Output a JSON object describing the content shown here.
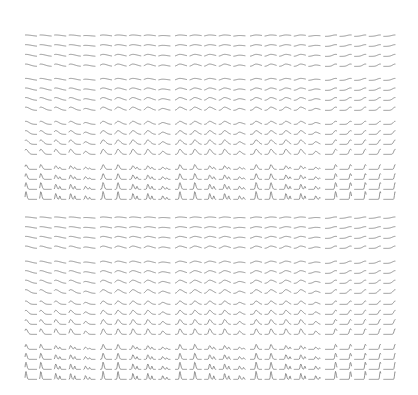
{
  "chart_data": {
    "type": "line",
    "title": "",
    "layout": {
      "columns": 25,
      "rows": 32,
      "column_groups": 5,
      "columns_per_group": 5,
      "row_groups": 8,
      "rows_per_group": 4,
      "column_group_x": [
        25,
        100,
        175,
        250,
        325
      ],
      "column_stride": 14.6,
      "row_group_y": [
        29,
        73,
        117,
        162,
        211,
        256,
        297,
        342
      ],
      "row_stride": 10,
      "cell_width": 12,
      "cell_height": 8
    },
    "style": {
      "stroke": "#7a7a7a",
      "stroke_width": 0.8,
      "background": "#ffffff"
    },
    "series_model": {
      "note": "Each sparkline is a skewed peak; peak position shifts right across column groups, peak sharpness/height grows down rows within each row group and across row groups.",
      "peak_position_by_column_group": [
        0.12,
        0.3,
        0.45,
        0.55,
        0.92
      ],
      "peak_height_by_row_group": [
        0.25,
        0.35,
        0.55,
        0.85,
        0.25,
        0.4,
        0.6,
        0.9
      ],
      "sharpness_by_row_group": [
        0.35,
        0.3,
        0.18,
        0.08,
        0.35,
        0.28,
        0.14,
        0.07
      ]
    }
  }
}
